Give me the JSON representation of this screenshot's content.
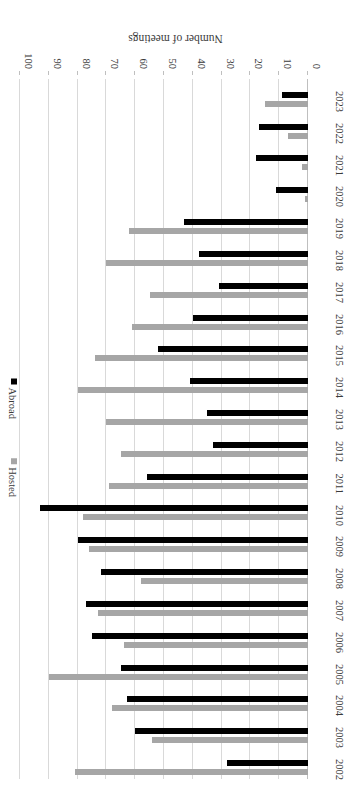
{
  "chart_data": {
    "type": "bar",
    "orientation": "horizontal",
    "title": "",
    "xlabel": "",
    "ylabel": "Number of meetings",
    "ylim": [
      0,
      100
    ],
    "ytick_labels": [
      "0",
      "10",
      "20",
      "30",
      "40",
      "50",
      "60",
      "70",
      "80",
      "90",
      "100"
    ],
    "ytick_values": [
      0,
      10,
      20,
      30,
      40,
      50,
      60,
      70,
      80,
      90,
      100
    ],
    "grid": true,
    "legend_position": "right",
    "categories": [
      "2002",
      "2003",
      "2004",
      "2005",
      "2006",
      "2007",
      "2008",
      "2009",
      "2010",
      "2011",
      "2012",
      "2013",
      "2014",
      "2015",
      "2016",
      "2017",
      "2018",
      "2019",
      "2020",
      "2021",
      "2022",
      "2023"
    ],
    "series": [
      {
        "name": "Hosted",
        "color": "#a6a6a6",
        "values": [
          81,
          54,
          68,
          90,
          64,
          73,
          58,
          76,
          78,
          69,
          65,
          70,
          80,
          74,
          61,
          55,
          70,
          62,
          1,
          2,
          7,
          15
        ]
      },
      {
        "name": "Abroad",
        "color": "#000000",
        "values": [
          28,
          60,
          63,
          65,
          75,
          77,
          72,
          80,
          93,
          56,
          33,
          35,
          41,
          52,
          40,
          31,
          38,
          43,
          11,
          18,
          17,
          9
        ]
      }
    ]
  },
  "axis": {
    "value_axis_title": "Number of meetings"
  },
  "legend": {
    "items": [
      {
        "label": "Hosted",
        "color": "#a6a6a6",
        "marker": "square-marker"
      },
      {
        "label": "Abroad",
        "color": "#000000",
        "marker": "square-marker"
      }
    ]
  }
}
